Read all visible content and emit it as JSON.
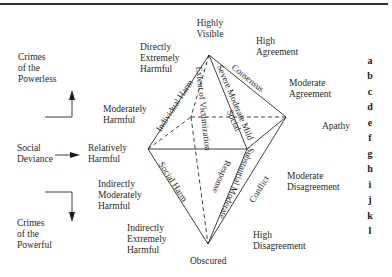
{
  "left_column": {
    "top_label": "Crimes\nof the\nPowerless",
    "middle_label": "Social\nDeviance",
    "bottom_label": "Crimes\nof the\nPowerful"
  },
  "harm_scale": {
    "directly_extremely": "Directly\nExtremely\nHarmful",
    "moderately": "Moderately\nHarmful",
    "relatively": "Relatively\nHarmful",
    "indirectly_moderately": "Indirectly\nModerately\nHarmful",
    "indirectly_extremely": "Indirectly\nExtremely\nHarmful"
  },
  "visibility": {
    "top": "Highly\nVisible",
    "bottom": "Obscured"
  },
  "agreement_scale": {
    "high_agreement": "High\nAgreement",
    "moderate_agreement": "Moderate\nAgreement",
    "apathy": "Apathy",
    "moderate_disagreement": "Moderate\nDisagreement",
    "high_disagreement": "High\nDisagreement"
  },
  "edge_labels": {
    "individual_harm": "Individual Harm",
    "social_harm": "Social Harm",
    "consensus": "Consensus",
    "conflict": "Conflict",
    "severity": "Severe Moderate Mild",
    "social": "Social",
    "response": "Response",
    "severity_lower": "Substantial Moderate",
    "extent": "Extent of Victimization"
  },
  "letters": [
    "a",
    "b",
    "c",
    "d",
    "e",
    "f",
    "g",
    "h",
    "i",
    "j",
    "k",
    "l"
  ],
  "diagram": {
    "vertices": {
      "top": [
        209,
        55
      ],
      "left": [
        148,
        149
      ],
      "right_front": [
        247,
        149
      ],
      "right_back": [
        286,
        117
      ],
      "back": [
        191,
        117
      ],
      "bottom": [
        208,
        244
      ]
    },
    "line_color": "#2a2a2a"
  }
}
